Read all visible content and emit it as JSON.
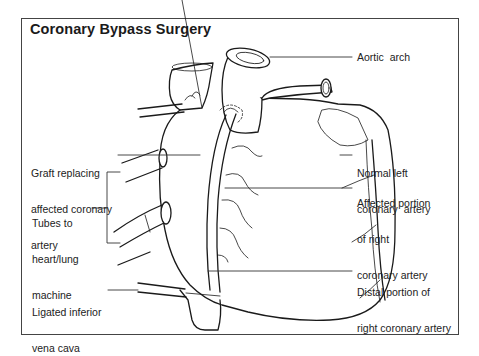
{
  "title": "Coronary Bypass Surgery",
  "labels": {
    "aortic_arch": "Aortic  arch",
    "graft": [
      "Graft replacing",
      "affected coronary",
      "artery"
    ],
    "tubes": [
      "Tubes to",
      "heart/lung",
      "machine"
    ],
    "ligated": [
      "Ligated inferior",
      "vena cava"
    ],
    "normal_left": [
      "Normal left",
      "coronary  artery"
    ],
    "affected_right": [
      "Affected portion",
      "of right",
      "coronary artery"
    ],
    "distal_right": [
      "Distal portion of",
      "right coronary artery"
    ]
  }
}
